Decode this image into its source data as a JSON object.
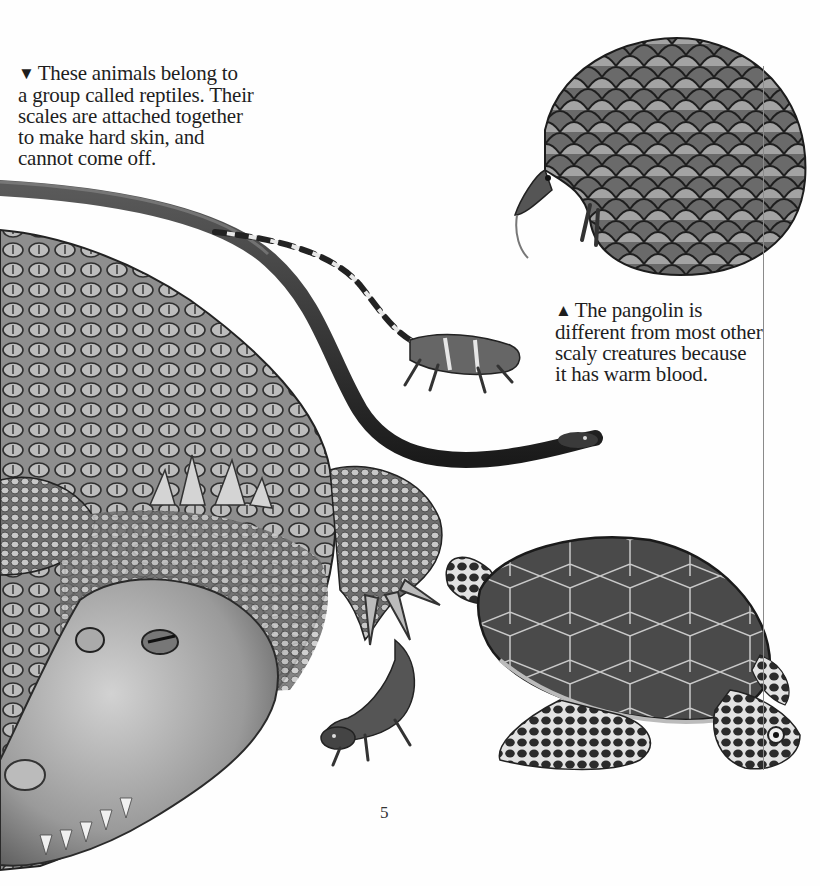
{
  "page": {
    "number": "5",
    "colors": {
      "background": "#fefefe",
      "text": "#1e1e1e",
      "rule": "#8a8a8a"
    }
  },
  "captions": {
    "reptiles": {
      "marker": "▼",
      "lines": [
        "These animals belong to",
        "a group called reptiles. Their",
        "scales are attached together",
        "to make hard skin, and",
        "cannot come off."
      ]
    },
    "pangolin": {
      "marker": "▲",
      "lines": [
        "The pangolin is",
        "different from most other",
        "scaly creatures because",
        "it has warm blood."
      ]
    }
  },
  "illustrations": [
    {
      "id": "crocodile",
      "label": "Crocodile"
    },
    {
      "id": "snake",
      "label": "Snake"
    },
    {
      "id": "iguana",
      "label": "Banded lizard"
    },
    {
      "id": "pangolin",
      "label": "Pangolin"
    },
    {
      "id": "sea-turtle",
      "label": "Sea turtle"
    },
    {
      "id": "tuatara",
      "label": "Tuatara"
    }
  ]
}
